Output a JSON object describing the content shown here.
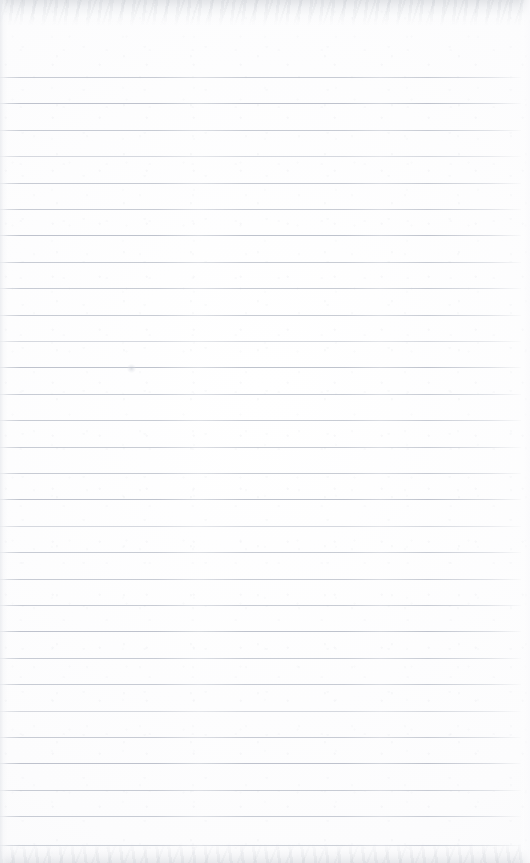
{
  "page": {
    "width": 530,
    "height": 863,
    "background_color": "#fefeff",
    "content_text": "",
    "is_blank": true
  },
  "ruling": {
    "style": "wide-ruled horizontal lines",
    "line_color": "#b9bec9",
    "line_thickness_px": 1,
    "first_line_y": 77,
    "line_spacing_px": 26.4,
    "line_count": 30,
    "line_start_x": 0,
    "line_end_x": 521,
    "has_margin_rule": false,
    "line_y_positions": [
      77,
      103,
      130,
      156,
      183,
      209,
      235,
      262,
      288,
      315,
      341,
      367,
      394,
      420,
      447,
      473,
      499,
      526,
      552,
      579,
      605,
      631,
      658,
      684,
      711,
      737,
      763,
      790,
      816,
      845
    ]
  },
  "scan_artifacts": {
    "top_edge_band": "light gray mottled scan band",
    "bottom_edge_band": "light gray mottled scan band",
    "left_edge_shadow": "soft gray binding shadow",
    "right_edge_fade": "lines fade before right edge",
    "smudge": {
      "x": 131,
      "y": 368,
      "description": "faint pale smudge"
    }
  }
}
